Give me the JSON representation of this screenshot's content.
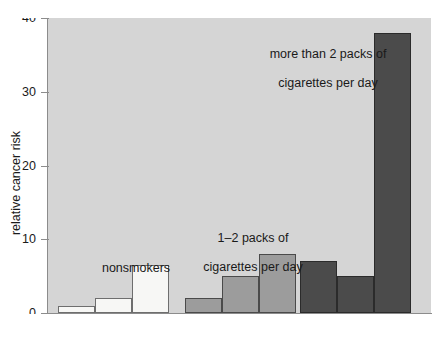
{
  "chart_data": {
    "type": "bar",
    "title": "",
    "xlabel": "number of alcoholic drinks per day",
    "ylabel": "relative cancer risk",
    "categories": [
      "0",
      "1–2",
      "4+"
    ],
    "ylim": [
      0,
      40
    ],
    "yticks": [
      0,
      10,
      20,
      30,
      40
    ],
    "ytick_labels": [
      "0",
      "10",
      "20",
      "30",
      "40"
    ],
    "grid": false,
    "legend_position": "in-plot annotations",
    "series": [
      {
        "name": "nonsmokers",
        "color": "#f7f7f5",
        "edge_color": "#6e6e6e",
        "values": [
          1,
          2,
          6.5
        ]
      },
      {
        "name": "1–2 packs of cigarettes per day",
        "color": "#9c9c9c",
        "edge_color": "#4a4a4a",
        "values": [
          2,
          5,
          8
        ]
      },
      {
        "name": "more than 2 packs of cigarettes per day",
        "color": "#4b4b4b",
        "edge_color": "#2b2b2b",
        "values": [
          7,
          5,
          38
        ]
      }
    ],
    "annotations": [
      {
        "text": "nonsmokers",
        "series": "nonsmokers"
      },
      {
        "text": "1–2 packs of\ncigarettes per day",
        "series": "1–2 packs of cigarettes per day"
      },
      {
        "text": "more than 2 packs of\ncigarettes per day",
        "series": "more than 2 packs of cigarettes per day"
      }
    ],
    "x_tick_labels": [
      "0",
      "1–2",
      "4+",
      "0",
      "1–2",
      "4+",
      "0",
      "1–2",
      "4+"
    ],
    "plot_background": "#d5d5d5",
    "axis_color": "#8c8c8c"
  },
  "axes": {
    "y": {
      "title": "relative cancer risk",
      "ticks": [
        {
          "label": "40",
          "value": 40
        },
        {
          "label": "30",
          "value": 30
        },
        {
          "label": "20",
          "value": 20
        },
        {
          "label": "10",
          "value": 10
        },
        {
          "label": "0",
          "value": 0
        }
      ]
    },
    "x": {
      "title": "number of alcoholic drinks per day",
      "ticks": [
        {
          "label": "0"
        },
        {
          "label": "1–2"
        },
        {
          "label": "4+"
        },
        {
          "label": "0"
        },
        {
          "label": "1–2"
        },
        {
          "label": "4+"
        },
        {
          "label": "0"
        },
        {
          "label": "1–2"
        },
        {
          "label": "4+"
        }
      ]
    }
  },
  "annotations": {
    "nonsmokers": "nonsmokers",
    "mid_line1": "1–2 packs of",
    "mid_line2": "cigarettes per day",
    "heavy_line1": "more than 2 packs of",
    "heavy_line2": "cigarettes per day"
  }
}
